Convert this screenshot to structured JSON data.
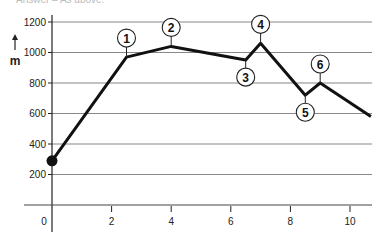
{
  "caption": "Answer – As above.",
  "chart_data": {
    "type": "line",
    "title": "",
    "xlabel": "",
    "ylabel": "m",
    "xlim": [
      -0.3,
      10.7
    ],
    "ylim": [
      0,
      1200
    ],
    "x_ticks": [
      0,
      2,
      4,
      6,
      8,
      10
    ],
    "y_ticks": [
      200,
      400,
      600,
      800,
      1000,
      1200
    ],
    "grid": "horizontal",
    "series": [
      {
        "name": "elevation profile",
        "x": [
          0,
          2.5,
          4,
          6.5,
          7,
          8.5,
          9,
          10.7
        ],
        "y": [
          290,
          970,
          1040,
          950,
          1060,
          720,
          800,
          580
        ]
      }
    ],
    "start_marker": {
      "x": 0,
      "y": 290
    },
    "annotations": [
      {
        "label": "1",
        "x": 2.5,
        "y": 970,
        "position": "above"
      },
      {
        "label": "2",
        "x": 4,
        "y": 1040,
        "position": "above"
      },
      {
        "label": "3",
        "x": 6.5,
        "y": 950,
        "position": "below"
      },
      {
        "label": "4",
        "x": 7,
        "y": 1060,
        "position": "above"
      },
      {
        "label": "5",
        "x": 8.5,
        "y": 720,
        "position": "below"
      },
      {
        "label": "6",
        "x": 9,
        "y": 800,
        "position": "above"
      }
    ]
  },
  "colors": {
    "line": "#111111",
    "grid": "#555555",
    "background": "#ffffff"
  }
}
